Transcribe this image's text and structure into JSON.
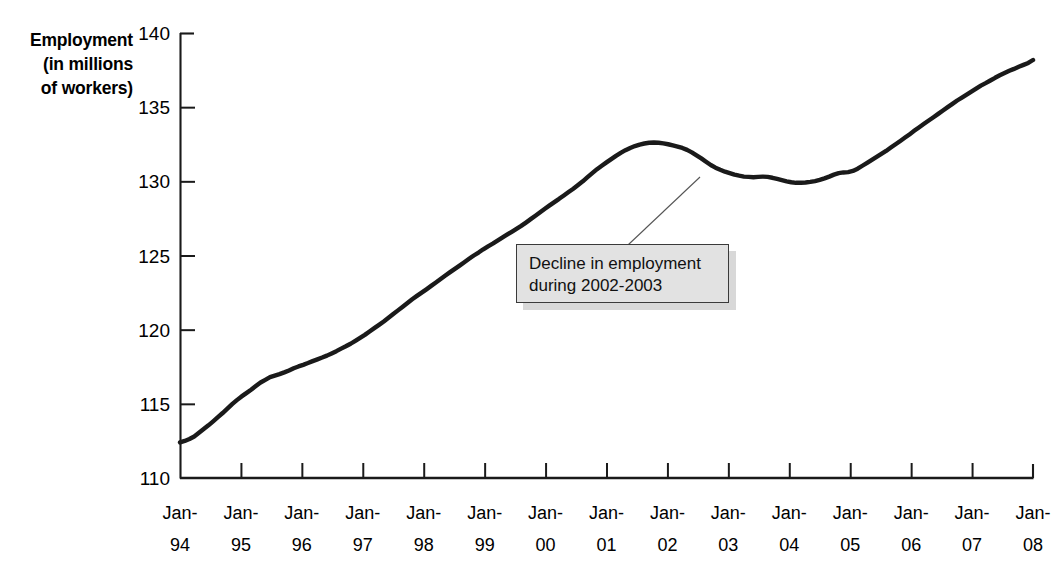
{
  "chart_data": {
    "type": "line",
    "title": "",
    "xlabel": "",
    "ylabel": "Employment (in millions of workers)",
    "ylabel_lines": [
      "Employment",
      "(in millions",
      "of workers)"
    ],
    "ylim": [
      110,
      140
    ],
    "y_ticks": [
      110,
      115,
      120,
      125,
      130,
      135,
      140
    ],
    "grid": false,
    "legend": "none",
    "line_color": "#1a1a1a",
    "x_tick_labels": [
      {
        "line1": "Jan-",
        "line2": "94"
      },
      {
        "line1": "Jan-",
        "line2": "95"
      },
      {
        "line1": "Jan-",
        "line2": "96"
      },
      {
        "line1": "Jan-",
        "line2": "97"
      },
      {
        "line1": "Jan-",
        "line2": "98"
      },
      {
        "line1": "Jan-",
        "line2": "99"
      },
      {
        "line1": "Jan-",
        "line2": "00"
      },
      {
        "line1": "Jan-",
        "line2": "01"
      },
      {
        "line1": "Jan-",
        "line2": "02"
      },
      {
        "line1": "Jan-",
        "line2": "03"
      },
      {
        "line1": "Jan-",
        "line2": "04"
      },
      {
        "line1": "Jan-",
        "line2": "05"
      },
      {
        "line1": "Jan-",
        "line2": "06"
      },
      {
        "line1": "Jan-",
        "line2": "07"
      },
      {
        "line1": "Jan-",
        "line2": "08"
      }
    ],
    "x_range_years": [
      1994,
      2008
    ],
    "x_points_per_year": 12,
    "series": [
      {
        "name": "Employment",
        "values": [
          112.4,
          112.5,
          112.63,
          112.8,
          113.05,
          113.3,
          113.55,
          113.82,
          114.1,
          114.38,
          114.68,
          114.98,
          115.25,
          115.5,
          115.72,
          115.95,
          116.2,
          116.44,
          116.62,
          116.8,
          116.9,
          117.0,
          117.12,
          117.25,
          117.4,
          117.52,
          117.63,
          117.75,
          117.88,
          118.0,
          118.12,
          118.25,
          118.4,
          118.55,
          118.72,
          118.88,
          119.05,
          119.25,
          119.45,
          119.65,
          119.88,
          120.1,
          120.32,
          120.55,
          120.8,
          121.05,
          121.3,
          121.55,
          121.8,
          122.05,
          122.28,
          122.5,
          122.72,
          122.95,
          123.18,
          123.42,
          123.65,
          123.88,
          124.1,
          124.32,
          124.55,
          124.78,
          125.0,
          125.2,
          125.42,
          125.62,
          125.8,
          126.0,
          126.2,
          126.4,
          126.6,
          126.8,
          127.0,
          127.22,
          127.45,
          127.68,
          127.92,
          128.15,
          128.38,
          128.6,
          128.82,
          129.05,
          129.28,
          129.5,
          129.75,
          130.0,
          130.28,
          130.55,
          130.82,
          131.05,
          131.28,
          131.5,
          131.72,
          131.92,
          132.1,
          132.25,
          132.38,
          132.48,
          132.55,
          132.6,
          132.62,
          132.6,
          132.56,
          132.5,
          132.42,
          132.34,
          132.25,
          132.12,
          131.95,
          131.75,
          131.55,
          131.32,
          131.1,
          130.92,
          130.78,
          130.65,
          130.55,
          130.45,
          130.38,
          130.32,
          130.3,
          130.28,
          130.3,
          130.32,
          130.3,
          130.24,
          130.16,
          130.08,
          130.0,
          129.94,
          129.9,
          129.9,
          129.92,
          129.96,
          130.02,
          130.1,
          130.2,
          130.32,
          130.45,
          130.55,
          130.6,
          130.62,
          130.7,
          130.85,
          131.05,
          131.25,
          131.45,
          131.65,
          131.85,
          132.05,
          132.28,
          132.5,
          132.72,
          132.95,
          133.18,
          133.42,
          133.65,
          133.88,
          134.1,
          134.32,
          134.55,
          134.78,
          135.0,
          135.22,
          135.45,
          135.65,
          135.85,
          136.05,
          136.25,
          136.45,
          136.62,
          136.8,
          136.98,
          137.15,
          137.3,
          137.45,
          137.58,
          137.72,
          137.85,
          137.98,
          138.18
        ]
      }
    ],
    "annotation": {
      "lines": [
        "Decline in employment",
        "during 2002-2003"
      ],
      "text": "Decline in employment during 2002-2003",
      "box_fill": "#e2e2e2",
      "box_border": "#3a3a3a",
      "shadow_color": "#c9c9c9",
      "leader_from": [
        628,
        245
      ],
      "leader_to": [
        700,
        177
      ]
    }
  }
}
